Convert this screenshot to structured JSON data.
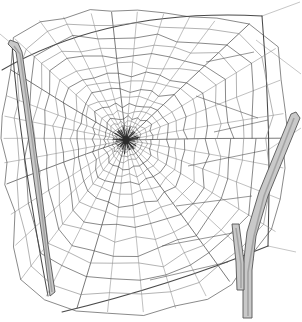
{
  "document": {
    "title": "Orb Spider Web",
    "subject": "spider-web",
    "medium": "pencil line drawing",
    "background_color": "#ffffff",
    "width": 302,
    "height": 322
  },
  "palette": {
    "background": "#ffffff",
    "web_thread": "#4a4a4a",
    "web_thread_light": "#8a8a8a",
    "frame_thread": "#3a3a3a",
    "twig_outline": "#555555",
    "twig_fill_light": "#c9c9c9",
    "twig_fill_dark": "#9a9a9a",
    "hub_dark": "#2b2b2b"
  },
  "geometry": {
    "hub": {
      "x": 126,
      "y": 140,
      "r_core": 7
    },
    "radial_count": 34,
    "spiral_ring_count": 17,
    "spiral_inner_radius": 9,
    "spiral_outer_radius": 175,
    "frame_top_arc": "M 2,70 Q 110,8 262,16",
    "frame_bottom_arc": "M 62,312 Q 170,286 268,246",
    "frame_left_edge": "M 12,44 Q 20,150 48,296",
    "frame_right_edge": "M 262,16 Q 272,130 268,246"
  },
  "elements": {
    "web_label": "orb web",
    "hub_label": "web hub",
    "left_twig_label": "left supporting twig",
    "right_twig_label": "forked supporting twig",
    "top_anchor_label": "top anchor thread",
    "bottom_anchor_label": "bottom anchor thread"
  },
  "twigs": [
    {
      "name": "left-twig",
      "outline": "M 10,40 L 18,43 L 22,52 L 30,108 L 40,180 L 48,245 L 55,292 L 50,296 L 44,250 L 34,180 L 24,106 L 16,52 L 8,44 Z",
      "highlight": "M 14,46 L 20,54 L 28,110 L 38,182 L 46,248 L 52,292",
      "tip": {
        "x": 10,
        "y": 40
      }
    },
    {
      "name": "right-twig-main",
      "outline": "M 296,112 L 300,118 L 268,196 L 256,236 L 252,270 L 252,318 L 243,318 L 243,268 L 247,232 L 259,192 L 291,114 Z",
      "highlight": "M 294,118 L 264,196 L 254,236 L 248,272 L 248,316",
      "tip": {
        "x": 296,
        "y": 112
      }
    },
    {
      "name": "right-twig-fork",
      "outline": "M 232,224 L 239,224 L 244,262 L 244,290 L 237,290 L 236,262 Z",
      "highlight": "M 236,228 L 241,264 L 241,288",
      "tip": {
        "x": 232,
        "y": 224
      }
    }
  ],
  "annotations": {
    "description": "A hand-drawn orb spider web strung between two bare twigs; dense radial spokes converge at a dark hub slightly left of centre, crossed by concentric spiral threads that widen toward the irregular outer frame."
  }
}
